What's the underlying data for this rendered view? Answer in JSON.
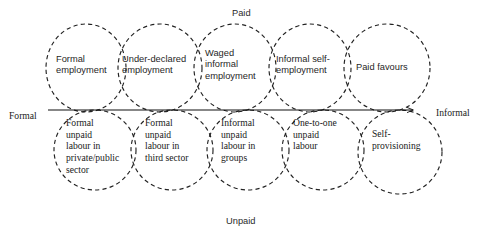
{
  "figure": {
    "type": "typology-diagram",
    "stroke_color": "#222222",
    "background_color": "#ffffff",
    "axis_line_color": "#111111"
  },
  "axes": {
    "vertical_top_label": "Paid",
    "vertical_bottom_label": "Unpaid",
    "horizontal_left_label": "Formal",
    "horizontal_right_label": "Informal",
    "horizontal_line": {
      "x_start": 48,
      "x_end": 413,
      "y": 110,
      "arrow_at": "right"
    }
  },
  "circles": {
    "top_row": [
      {
        "id": "formal-employment",
        "label": "Formal\nemployment",
        "cx": 86,
        "cy": 68,
        "rx": 40,
        "ry": 44,
        "label_x": 56,
        "label_y": 54
      },
      {
        "id": "under-declared-employment",
        "label": "Under-declared\nemployment",
        "cx": 160,
        "cy": 68,
        "rx": 42,
        "ry": 44,
        "label_x": 122,
        "label_y": 54
      },
      {
        "id": "waged-informal-employment",
        "label": "Waged\ninformal\nemployment",
        "cx": 235,
        "cy": 68,
        "rx": 41,
        "ry": 44,
        "label_x": 205,
        "label_y": 48
      },
      {
        "id": "informal-self-employment",
        "label": "Informal self-\nemployment",
        "cx": 310,
        "cy": 68,
        "rx": 41,
        "ry": 44,
        "label_x": 276,
        "label_y": 54
      },
      {
        "id": "paid-favours",
        "label": "Paid favours",
        "cx": 387,
        "cy": 68,
        "rx": 43,
        "ry": 44,
        "label_x": 356,
        "label_y": 62
      }
    ],
    "bottom_row": [
      {
        "id": "formal-unpaid-labour-private-public-sector",
        "label": "Formal\nunpaid\nlabour in\nprivate/public\nsector",
        "cx": 95,
        "cy": 150,
        "rx": 41,
        "ry": 40,
        "label_x": 66,
        "label_y": 117
      },
      {
        "id": "formal-unpaid-labour-third-sector",
        "label": "Formal\nunpaid\nlabour in\nthird sector",
        "cx": 172,
        "cy": 150,
        "rx": 41,
        "ry": 40,
        "label_x": 145,
        "label_y": 117
      },
      {
        "id": "informal-unpaid-labour-in-groups",
        "label": "Informal\nunpaid\nlabour in\ngroups",
        "cx": 248,
        "cy": 150,
        "rx": 41,
        "ry": 40,
        "label_x": 221,
        "label_y": 117
      },
      {
        "id": "one-to-one-unpaid-labour",
        "label": "One-to-one\nunpaid\nlabour",
        "cx": 323,
        "cy": 150,
        "rx": 41,
        "ry": 40,
        "label_x": 293,
        "label_y": 117
      },
      {
        "id": "self-provisioning",
        "label": "Self-\nprovisioning",
        "cx": 400,
        "cy": 152,
        "rx": 42,
        "ry": 42,
        "label_x": 372,
        "label_y": 128
      }
    ]
  },
  "axis_label_positions": {
    "paid": {
      "x": 232,
      "y": 8
    },
    "unpaid": {
      "x": 226,
      "y": 216
    },
    "formal": {
      "x": 9,
      "y": 110
    },
    "informal": {
      "x": 436,
      "y": 107
    }
  }
}
